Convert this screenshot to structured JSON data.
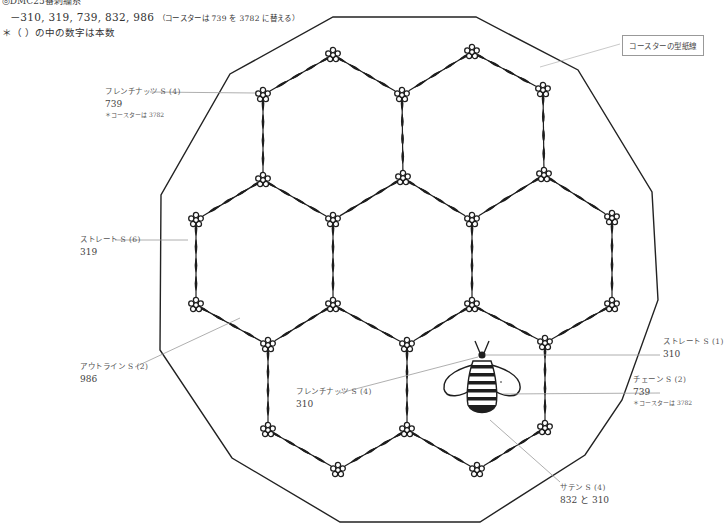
{
  "header": {
    "thread_title": "◎DMC25番刺繍糸",
    "colors_line": "－310, 319, 739, 832, 986",
    "colors_note": "（コースターは 739 を 3782 に替える）",
    "count_note": "＊（ ）の中の数字は本数"
  },
  "pattern_outline_label": "コースターの型紙線",
  "callouts": [
    {
      "id": "french-knot-flowers",
      "stitch": "フレンチナッツ S (4)",
      "color": "739",
      "note": "＊コースターは 3782"
    },
    {
      "id": "straight-leaves",
      "stitch": "ストレート S (6)",
      "color": "319"
    },
    {
      "id": "outline-stems",
      "stitch": "アウトライン S (2)",
      "color": "986"
    },
    {
      "id": "french-knot-bee-head",
      "stitch": "フレンチナッツ S (4)",
      "color": "310"
    },
    {
      "id": "straight-antennae",
      "stitch": "ストレート S (1)",
      "color": "310"
    },
    {
      "id": "chain-wings",
      "stitch": "チェーン S (2)",
      "color": "739",
      "note": "＊コースターは 3782"
    },
    {
      "id": "satin-body",
      "stitch": "サテン S (4)",
      "color": "832 と 310"
    }
  ],
  "diagram": {
    "outline_polygon": [
      [
        333,
        17
      ],
      [
        476,
        17
      ],
      [
        578,
        70
      ],
      [
        652,
        192
      ],
      [
        658,
        300
      ],
      [
        622,
        400
      ],
      [
        585,
        455
      ],
      [
        480,
        522
      ],
      [
        340,
        522
      ],
      [
        232,
        458
      ],
      [
        160,
        350
      ],
      [
        161,
        195
      ],
      [
        230,
        74
      ]
    ],
    "flower_nodes": [
      [
        333,
        55
      ],
      [
        472,
        52
      ],
      [
        263,
        95
      ],
      [
        402,
        95
      ],
      [
        543,
        90
      ],
      [
        263,
        180
      ],
      [
        403,
        178
      ],
      [
        544,
        175
      ],
      [
        196,
        220
      ],
      [
        333,
        220
      ],
      [
        472,
        220
      ],
      [
        612,
        218
      ],
      [
        196,
        305
      ],
      [
        333,
        305
      ],
      [
        472,
        305
      ],
      [
        612,
        305
      ],
      [
        268,
        345
      ],
      [
        407,
        345
      ],
      [
        545,
        343
      ],
      [
        268,
        430
      ],
      [
        407,
        430
      ],
      [
        545,
        428
      ],
      [
        338,
        470
      ],
      [
        477,
        470
      ]
    ],
    "garland_edges": [
      [
        0,
        2
      ],
      [
        0,
        3
      ],
      [
        1,
        3
      ],
      [
        1,
        4
      ],
      [
        2,
        5
      ],
      [
        3,
        6
      ],
      [
        4,
        7
      ],
      [
        5,
        8
      ],
      [
        5,
        9
      ],
      [
        6,
        9
      ],
      [
        6,
        10
      ],
      [
        7,
        10
      ],
      [
        7,
        11
      ],
      [
        8,
        12
      ],
      [
        9,
        13
      ],
      [
        10,
        14
      ],
      [
        11,
        15
      ],
      [
        12,
        16
      ],
      [
        13,
        16
      ],
      [
        13,
        17
      ],
      [
        14,
        17
      ],
      [
        14,
        18
      ],
      [
        15,
        18
      ],
      [
        16,
        19
      ],
      [
        17,
        20
      ],
      [
        18,
        21
      ],
      [
        19,
        22
      ],
      [
        20,
        22
      ],
      [
        20,
        23
      ],
      [
        21,
        23
      ]
    ],
    "bee": {
      "x": 482,
      "y": 385
    },
    "colors": {
      "ink": "#1e1e1e",
      "leader": "#aaaaaa",
      "outline": "#222222"
    }
  }
}
